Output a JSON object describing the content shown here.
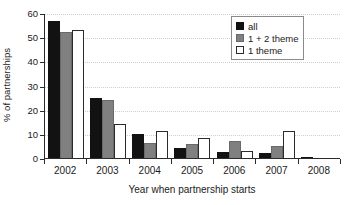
{
  "chart_data": {
    "type": "bar",
    "title": "",
    "subtitle": "",
    "xlabel": "Year when partnership starts",
    "ylabel": "% of partnerships",
    "categories": [
      "2002",
      "2003",
      "2004",
      "2005",
      "2006",
      "2007",
      "2008"
    ],
    "ylim": [
      0,
      60
    ],
    "yticks": [
      0,
      10,
      20,
      30,
      40,
      50,
      60
    ],
    "ytick_labels": [
      "0",
      "10",
      "20",
      "30",
      "40",
      "50",
      "60"
    ],
    "grid": "horizontal-dotted",
    "legend_position": "top-right",
    "series": [
      {
        "name": "all",
        "color": "#121212",
        "values": [
          56.5,
          25.0,
          9.8,
          4.0,
          2.3,
          2.2,
          0.6
        ]
      },
      {
        "name": "1 + 2 theme",
        "color": "#808080",
        "values": [
          52.0,
          24.2,
          6.1,
          6.0,
          7.2,
          5.0,
          0
        ]
      },
      {
        "name": "1 theme",
        "color": "#ffffff",
        "values": [
          53.0,
          14.0,
          11.3,
          8.4,
          3.0,
          11.3,
          0
        ]
      }
    ]
  },
  "legend": {
    "entries": [
      {
        "label": "all"
      },
      {
        "label": "1 + 2 theme"
      },
      {
        "label": "1 theme"
      }
    ]
  }
}
